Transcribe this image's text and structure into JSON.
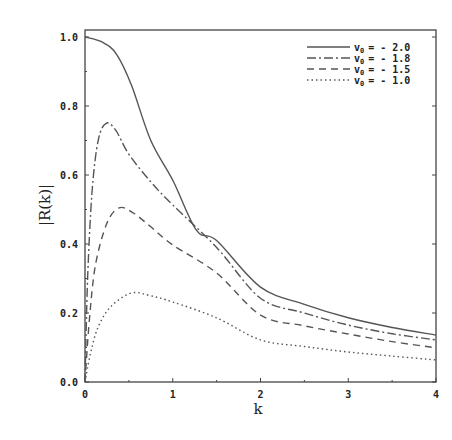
{
  "chart_data": {
    "type": "line",
    "title": "",
    "xlabel": "k",
    "ylabel": "|R(k)|",
    "xlim": [
      0,
      4
    ],
    "ylim": [
      0,
      1.0
    ],
    "xticks": [
      "0",
      "1",
      "2",
      "3",
      "4"
    ],
    "yticks": [
      "0.0",
      "0.2",
      "0.4",
      "0.6",
      "0.8",
      "1.0"
    ],
    "grid": false,
    "legend_position": "upper right",
    "series": [
      {
        "name": "v0 = - 2.0",
        "legend_var": "v",
        "legend_sub": "0",
        "legend_value": "= - 2.0",
        "style": "solid",
        "x": [
          0,
          0.2,
          0.36,
          0.53,
          0.75,
          1.0,
          1.27,
          1.5,
          2.0,
          2.5,
          3.0,
          3.5,
          4.0
        ],
        "y": [
          1.0,
          0.985,
          0.95,
          0.86,
          0.7,
          0.585,
          0.44,
          0.41,
          0.275,
          0.225,
          0.186,
          0.158,
          0.136
        ]
      },
      {
        "name": "v0 = - 1.8",
        "legend_var": "v",
        "legend_sub": "0",
        "legend_value": "= - 1.8",
        "style": "dashdot",
        "x": [
          0,
          0.03,
          0.08,
          0.15,
          0.24,
          0.35,
          0.5,
          0.75,
          1.0,
          1.5,
          2.0,
          2.5,
          3.0,
          3.5,
          4.0
        ],
        "y": [
          0.0,
          0.3,
          0.55,
          0.7,
          0.75,
          0.73,
          0.66,
          0.58,
          0.513,
          0.39,
          0.243,
          0.2,
          0.165,
          0.14,
          0.122
        ]
      },
      {
        "name": "v0 = - 1.5",
        "legend_var": "v",
        "legend_sub": "0",
        "legend_value": "= - 1.5",
        "style": "dashed",
        "x": [
          0,
          0.05,
          0.12,
          0.25,
          0.39,
          0.55,
          0.75,
          1.0,
          1.5,
          2.0,
          2.5,
          3.0,
          3.5,
          4.0
        ],
        "y": [
          0.0,
          0.18,
          0.34,
          0.46,
          0.505,
          0.49,
          0.45,
          0.397,
          0.316,
          0.194,
          0.163,
          0.139,
          0.117,
          0.099
        ]
      },
      {
        "name": "v0 = - 1.0",
        "legend_var": "v",
        "legend_sub": "0",
        "legend_value": "= - 1.0",
        "style": "dotted",
        "x": [
          0,
          0.06,
          0.15,
          0.3,
          0.53,
          0.75,
          1.0,
          1.5,
          2.0,
          2.5,
          3.0,
          3.5,
          4.0
        ],
        "y": [
          0.0,
          0.08,
          0.16,
          0.22,
          0.258,
          0.25,
          0.232,
          0.186,
          0.122,
          0.103,
          0.087,
          0.075,
          0.064
        ]
      }
    ]
  }
}
